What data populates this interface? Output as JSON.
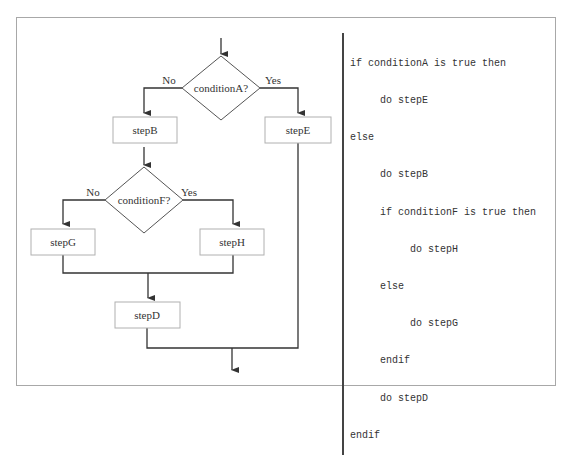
{
  "flowchart": {
    "decisions": [
      {
        "id": "conditionA",
        "label": "conditionA?",
        "no_label": "No",
        "yes_label": "Yes"
      },
      {
        "id": "conditionF",
        "label": "conditionF?",
        "no_label": "No",
        "yes_label": "Yes"
      }
    ],
    "steps": {
      "stepB": "stepB",
      "stepE": "stepE",
      "stepG": "stepG",
      "stepH": "stepH",
      "stepD": "stepD"
    }
  },
  "pseudocode": {
    "lines": [
      "if conditionA is true then",
      "     do stepE",
      "else",
      "     do stepB",
      "     if conditionF is true then",
      "          do stepH",
      "     else",
      "          do stepG",
      "     endif",
      "     do stepD",
      "endif"
    ]
  },
  "colors": {
    "line": "#333333",
    "box_border": "#b0b0b0",
    "frame_border": "#a8a8a8"
  }
}
